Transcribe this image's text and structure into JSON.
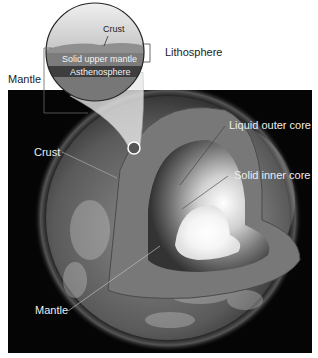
{
  "diagram": {
    "colors": {
      "background": "#ffffff",
      "panel": "#050505",
      "crust_band": "#8a8a8a",
      "upper_mantle_band": "#7a7a7a",
      "asthenosphere_band": "#3c3c3c",
      "lower_mantle": "#6a6a6a",
      "outer_core": "#d8d8d8",
      "inner_core": "#ffffff"
    },
    "magnifier": {
      "labels": {
        "crust": "Crust",
        "solid_upper_mantle": "Solid upper mantle",
        "asthenosphere": "Asthenosphere"
      }
    },
    "labels": {
      "lithosphere": "Lithosphere",
      "mantle_top": "Mantle",
      "crust": "Crust",
      "liquid_outer_core": "Liquid outer core",
      "solid_inner_core": "Solid inner core",
      "mantle_bottom": "Mantle"
    }
  }
}
